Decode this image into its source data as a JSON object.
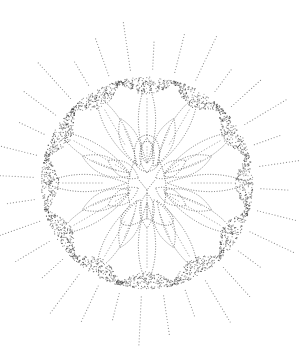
{
  "image": {
    "subject": "stippled lotus mandala with seated figure",
    "background": "#ffffff",
    "ink": "#3a3a3a",
    "center": [
      147,
      183
    ],
    "ring_radius": 106,
    "ray_count": 32,
    "petal_layers": 3
  }
}
